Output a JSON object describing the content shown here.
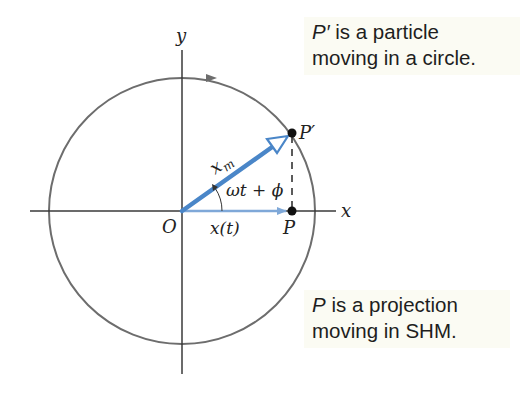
{
  "diagram": {
    "type": "phasor-circle-shm",
    "labels": {
      "y_axis": "y",
      "x_axis": "x",
      "origin": "O",
      "particle": "P′",
      "projection": "P",
      "amplitude": "x",
      "amplitude_sub": "m",
      "angle": "ωt + ϕ",
      "displacement": "x(t)"
    },
    "callouts": {
      "top": {
        "var": "P′",
        "line1_rest": " is a particle",
        "line2": "moving in a circle."
      },
      "bottom": {
        "var": "P",
        "line1_rest": " is a projection",
        "line2": "moving in SHM."
      }
    },
    "colors": {
      "circle": "#6d6d6d",
      "axes": "#3a3a3a",
      "phasor": "#4a86c8",
      "displacement": "#7fa8d8",
      "callout_bg": "#fbfbf3",
      "text": "#1e1e1e"
    },
    "geometry": {
      "origin": [
        182,
        211
      ],
      "radius": 133,
      "angle_deg": 35,
      "particle_point": [
        292,
        133
      ],
      "projection_point": [
        292,
        211
      ]
    }
  }
}
